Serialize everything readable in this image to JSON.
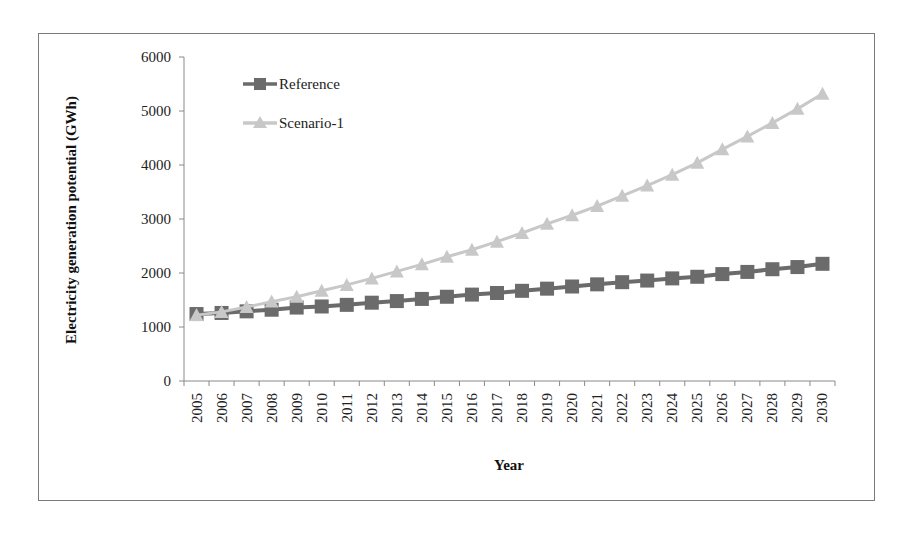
{
  "chart_data": {
    "type": "line",
    "title": "",
    "xlabel": "Year",
    "ylabel": "Electricity generation potential (GWh)",
    "ylim": [
      0,
      6000
    ],
    "yticks": [
      0,
      1000,
      2000,
      3000,
      4000,
      5000,
      6000
    ],
    "grid": false,
    "legend_position": "upper-left inside",
    "categories": [
      "2005",
      "2006",
      "2007",
      "2008",
      "2009",
      "2010",
      "2011",
      "2012",
      "2013",
      "2014",
      "2015",
      "2016",
      "2017",
      "2018",
      "2019",
      "2020",
      "2021",
      "2022",
      "2023",
      "2024",
      "2025",
      "2026",
      "2027",
      "2028",
      "2029",
      "2030"
    ],
    "series": [
      {
        "name": "Reference",
        "marker": "square",
        "color": "#6b6b6b",
        "values": [
          1240,
          1260,
          1290,
          1320,
          1360,
          1380,
          1410,
          1450,
          1480,
          1520,
          1560,
          1600,
          1630,
          1670,
          1710,
          1750,
          1790,
          1830,
          1860,
          1900,
          1930,
          1980,
          2020,
          2070,
          2110,
          2170
        ]
      },
      {
        "name": "Scenario-1",
        "marker": "triangle",
        "color": "#c8c8c8",
        "values": [
          1220,
          1280,
          1370,
          1470,
          1560,
          1670,
          1780,
          1900,
          2030,
          2160,
          2300,
          2430,
          2580,
          2740,
          2910,
          3070,
          3240,
          3430,
          3620,
          3820,
          4040,
          4290,
          4530,
          4780,
          5040,
          5320
        ]
      }
    ]
  }
}
